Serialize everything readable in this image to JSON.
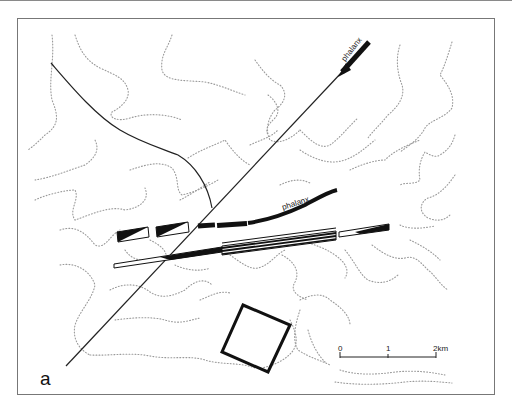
{
  "figure": {
    "panel_label": "a",
    "labels": {
      "phalanx_top": "phalanx",
      "phalanx_mid": "phalanx"
    },
    "scale_bar": {
      "ticks": [
        "0",
        "1",
        "2km"
      ]
    },
    "colors": {
      "ink": "#111111",
      "contour": "#9a9a9a",
      "frame": "#777777"
    }
  }
}
